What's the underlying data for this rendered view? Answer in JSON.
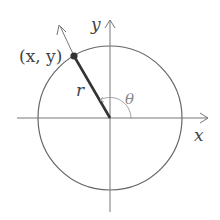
{
  "diagram": {
    "type": "polar-coordinates",
    "labels": {
      "point": "(x, y)",
      "radius": "r",
      "angle": "θ",
      "x_axis": "x",
      "y_axis": "y"
    },
    "colors": {
      "stroke": "#555555",
      "radius_line": "#333333",
      "point": "#333333",
      "text": "#444444"
    }
  }
}
